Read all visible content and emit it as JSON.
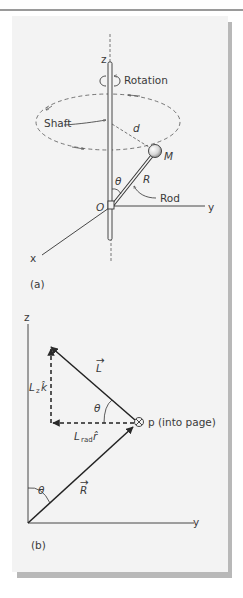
{
  "figure": {
    "panel_a": {
      "caption": "(a)",
      "labels": {
        "z_axis": "z",
        "y_axis": "y",
        "x_axis": "x",
        "rotation": "Rotation",
        "shaft": "Shaft",
        "distance": "d",
        "mass": "M",
        "angle": "θ",
        "radius": "R",
        "rod": "Rod",
        "origin": "O"
      }
    },
    "panel_b": {
      "caption": "(b)",
      "labels": {
        "z_axis": "z",
        "y_axis": "y",
        "angular_momentum": "L",
        "lz_main": "L",
        "lz_sub": "z",
        "lz_unit": "k̂",
        "lrad_main": "L",
        "lrad_sub": "rad",
        "lrad_unit": "r̂",
        "angle_top": "θ",
        "angle_bottom": "θ",
        "position": "R",
        "momentum_symbol": "⊗",
        "momentum": "p (into page)"
      }
    }
  },
  "colors": {
    "ink": "#2a2a2a",
    "panel_bg": "#f3f3f3",
    "shadow": "#b8b8b8"
  }
}
